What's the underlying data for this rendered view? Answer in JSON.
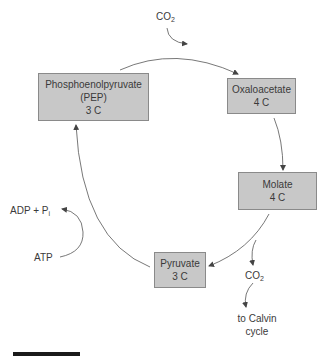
{
  "diagram": {
    "nodes": [
      {
        "id": "pep",
        "lines": [
          "Phosphoenolpyruvate",
          "(PEP)",
          "3 C"
        ]
      },
      {
        "id": "oxaloacetate",
        "lines": [
          "Oxaloacetate",
          "4 C"
        ]
      },
      {
        "id": "molate",
        "lines": [
          "Molate",
          "4 C"
        ]
      },
      {
        "id": "pyruvate",
        "lines": [
          "Pyruvate",
          "3 C"
        ]
      }
    ],
    "labels": {
      "co2_in": {
        "main": "CO",
        "sub": "2"
      },
      "co2_out": {
        "main": "CO",
        "sub": "2"
      },
      "adp_pi": {
        "main": "ADP + P",
        "sub": "i"
      },
      "atp": "ATP",
      "to_calvin": [
        "to Calvin",
        "cycle"
      ]
    },
    "edges": [
      {
        "from": "pep",
        "to": "oxaloacetate",
        "input": "CO2"
      },
      {
        "from": "oxaloacetate",
        "to": "molate"
      },
      {
        "from": "molate",
        "to": "pyruvate",
        "output": "CO2 to Calvin cycle"
      },
      {
        "from": "pyruvate",
        "to": "pep",
        "cofactor": "ATP -> ADP + Pi"
      }
    ],
    "colors": {
      "box_fill": "#c8c8c8",
      "box_border": "#8a8a8a",
      "line": "#555555",
      "text": "#3a3a3a"
    }
  }
}
